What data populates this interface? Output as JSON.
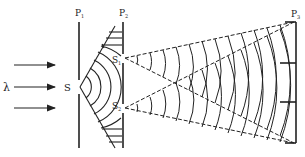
{
  "diagram": {
    "labels": {
      "wavelength": "λ",
      "source": "S",
      "slit1": "S",
      "slit1_sub": "1",
      "slit2": "S",
      "slit2_sub": "2",
      "plane1": "P",
      "plane1_sub": "1",
      "plane2": "P",
      "plane2_sub": "2",
      "plane3": "P",
      "plane3_sub": "3"
    },
    "colors": {
      "ink": "#222222",
      "background": "#ffffff"
    }
  }
}
